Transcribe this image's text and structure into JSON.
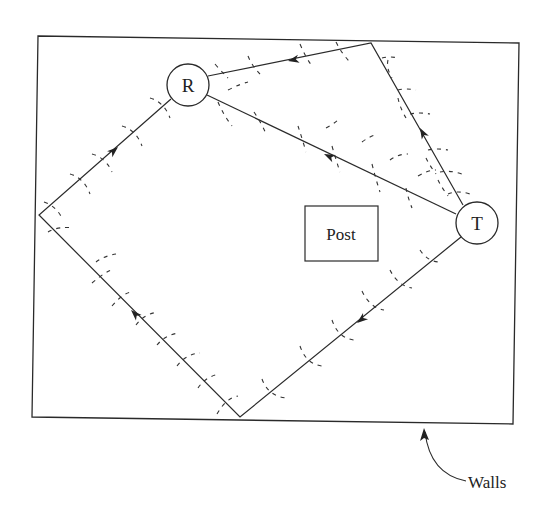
{
  "diagram": {
    "title": "",
    "nodes": {
      "receiver": {
        "label": "R",
        "cx": 188,
        "cy": 85,
        "r": 21
      },
      "transmitter": {
        "label": "T",
        "cx": 477,
        "cy": 223,
        "r": 21
      }
    },
    "obstacle": {
      "label": "Post",
      "x": 305,
      "y": 206,
      "w": 73,
      "h": 55
    },
    "walls": {
      "label": "Walls",
      "points": "38,36 519,43 513,424 32,417"
    },
    "paths": [
      {
        "name": "direct-path",
        "from": "T",
        "to": "R",
        "points": "456,214 207,96",
        "arrow_at": [
          330,
          157
        ],
        "arrow_angle": 205
      },
      {
        "name": "top-wall-path",
        "points": "463,205 371,43 208,76",
        "arrow_at": [
          [
            415,
            124
          ],
          [
            290,
            60
          ]
        ],
        "arrow_angle": [
          241,
          193
        ]
      },
      {
        "name": "left-bottom-path",
        "points": "461,236 240,417 39,215 171,99",
        "arrow_at": [
          [
            342,
            335
          ],
          [
            133,
            301
          ],
          [
            92,
            170
          ]
        ],
        "arrow_angle": [
          140,
          225,
          318
        ]
      }
    ],
    "colors": {
      "line": "#2a2a2a",
      "background": "#ffffff"
    }
  }
}
